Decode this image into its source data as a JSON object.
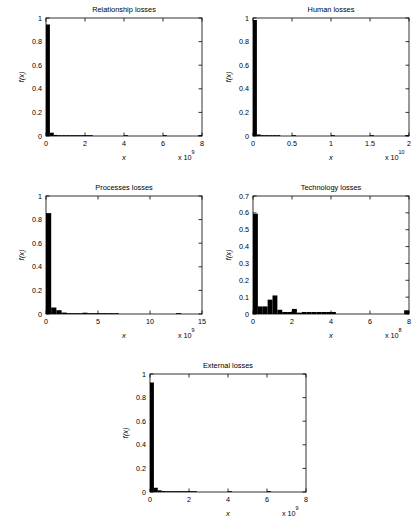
{
  "figure": {
    "name": "operational-risk-loss-severity-histograms",
    "panel_count": 5
  },
  "chart_data": [
    {
      "id": "relationship",
      "type": "bar",
      "title": "Relationship losses",
      "xlabel": "x",
      "ylabel": "f(x)",
      "x_exponent_prefix": "x 10",
      "x_exponent": "9",
      "xlim": [
        0,
        8
      ],
      "ylim": [
        0,
        1
      ],
      "xticks": [
        0,
        2,
        4,
        6,
        8
      ],
      "xticklabels": [
        "0",
        "2",
        "4",
        "6",
        "8"
      ],
      "yticks": [
        0,
        0.2,
        0.4,
        0.6,
        0.8,
        1
      ],
      "yticklabels": [
        "0",
        "0.2",
        "0.4",
        "0.6",
        "0.8",
        "1"
      ],
      "grid": false,
      "bin_width": 0.2,
      "bin_starts": [
        0,
        0.2,
        0.4,
        0.6,
        0.8,
        1.0,
        1.2,
        1.4,
        1.6,
        1.8,
        2.0,
        2.2,
        2.4,
        2.6,
        2.8,
        3.0,
        3.2,
        3.4,
        3.6,
        3.8,
        4.0,
        4.2,
        4.4,
        4.6,
        4.8,
        5.0,
        5.2,
        5.4,
        5.6,
        5.8,
        6.0,
        6.2,
        6.4,
        6.6,
        6.8,
        7.0,
        7.2,
        7.4,
        7.6,
        7.8
      ],
      "values": [
        0.945,
        0.028,
        0.009,
        0.005,
        0.004,
        0.002,
        0.002,
        0.001,
        0.001,
        0.001,
        0.002,
        0.001,
        0,
        0,
        0,
        0,
        0,
        0,
        0,
        0,
        0.001,
        0,
        0,
        0,
        0,
        0,
        0,
        0,
        0,
        0,
        0.001,
        0,
        0,
        0,
        0,
        0,
        0,
        0,
        0,
        0.001
      ]
    },
    {
      "id": "human",
      "type": "bar",
      "title": "Human losses",
      "xlabel": "x",
      "ylabel": "f(x)",
      "x_exponent_prefix": "x 10",
      "x_exponent": "10",
      "xlim": [
        0,
        2
      ],
      "ylim": [
        0,
        1
      ],
      "xticks": [
        0,
        0.5,
        1,
        1.5,
        2
      ],
      "xticklabels": [
        "0",
        "0.5",
        "1",
        "1.5",
        "2"
      ],
      "yticks": [
        0,
        0.2,
        0.4,
        0.6,
        0.8,
        1
      ],
      "yticklabels": [
        "0",
        "0.2",
        "0.4",
        "0.6",
        "0.8",
        "1"
      ],
      "grid": false,
      "bin_width": 0.05,
      "bin_starts": [
        0,
        0.05,
        0.1,
        0.15,
        0.2,
        0.25,
        0.3,
        0.35,
        0.4,
        0.45,
        0.5,
        0.55,
        0.6,
        0.65,
        0.7,
        0.75,
        0.8,
        0.85,
        0.9,
        0.95,
        1.0,
        1.05,
        1.1,
        1.15,
        1.2,
        1.25,
        1.3,
        1.35,
        1.4,
        1.45,
        1.5,
        1.55,
        1.6,
        1.65,
        1.7,
        1.75,
        1.8,
        1.85,
        1.9,
        1.95
      ],
      "values": [
        0.983,
        0.013,
        0.004,
        0.002,
        0.001,
        0.001,
        0.001,
        0,
        0,
        0,
        0.001,
        0,
        0,
        0,
        0,
        0,
        0,
        0,
        0,
        0,
        0.001,
        0,
        0,
        0,
        0,
        0,
        0,
        0,
        0,
        0,
        0.001,
        0,
        0,
        0,
        0,
        0,
        0,
        0,
        0,
        0.001
      ]
    },
    {
      "id": "processes",
      "type": "bar",
      "title": "Processes losses",
      "xlabel": "x",
      "ylabel": "f(x)",
      "x_exponent_prefix": "x 10",
      "x_exponent": "9",
      "xlim": [
        0,
        15
      ],
      "ylim": [
        0,
        1
      ],
      "xticks": [
        0,
        5,
        10,
        15
      ],
      "xticklabels": [
        "0",
        "5",
        "10",
        "15"
      ],
      "yticks": [
        0,
        0.2,
        0.4,
        0.6,
        0.8,
        1
      ],
      "yticklabels": [
        "0",
        "0.2",
        "0.4",
        "0.6",
        "0.8",
        "1"
      ],
      "grid": false,
      "bin_width": 0.5,
      "bin_starts": [
        0,
        0.5,
        1.0,
        1.5,
        2.0,
        2.5,
        3.0,
        3.5,
        4.0,
        4.5,
        5.0,
        5.5,
        6.0,
        6.5,
        7.0,
        7.5,
        8.0,
        8.5,
        9.0,
        9.5,
        10.0,
        10.5,
        11.0,
        11.5,
        12.0,
        12.5,
        13.0,
        13.5,
        14.0,
        14.5
      ],
      "values": [
        0.855,
        0.055,
        0.032,
        0.012,
        0.006,
        0.004,
        0.004,
        0.011,
        0.004,
        0.003,
        0.006,
        0.002,
        0.001,
        0.001,
        0,
        0,
        0,
        0,
        0,
        0,
        0,
        0,
        0,
        0,
        0,
        0.004,
        0,
        0,
        0,
        0
      ]
    },
    {
      "id": "technology",
      "type": "bar",
      "title": "Technology losses",
      "xlabel": "x",
      "ylabel": "f(x)",
      "x_exponent_prefix": "x 10",
      "x_exponent": "8",
      "xlim": [
        0,
        8
      ],
      "ylim": [
        0,
        0.7
      ],
      "xticks": [
        0,
        2,
        4,
        6,
        8
      ],
      "xticklabels": [
        "0",
        "2",
        "4",
        "6",
        "8"
      ],
      "yticks": [
        0,
        0.1,
        0.2,
        0.3,
        0.4,
        0.5,
        0.6,
        0.7
      ],
      "yticklabels": [
        "0",
        "0.1",
        "0.2",
        "0.3",
        "0.4",
        "0.5",
        "0.6",
        "0.7"
      ],
      "grid": false,
      "bin_width": 0.25,
      "bin_starts": [
        0,
        0.25,
        0.5,
        0.75,
        1.0,
        1.25,
        1.5,
        1.75,
        2.0,
        2.25,
        2.5,
        2.75,
        3.0,
        3.25,
        3.5,
        3.75,
        4.0,
        4.25,
        4.5,
        4.75,
        5.0,
        5.25,
        5.5,
        5.75,
        6.0,
        6.25,
        6.5,
        6.75,
        7.0,
        7.25,
        7.5,
        7.75
      ],
      "values": [
        0.595,
        0.045,
        0.045,
        0.085,
        0.11,
        0.025,
        0.012,
        0.012,
        0.03,
        0.008,
        0.012,
        0.012,
        0.012,
        0.012,
        0.012,
        0.012,
        0.012,
        0,
        0,
        0,
        0,
        0,
        0,
        0,
        0,
        0,
        0,
        0,
        0,
        0,
        0,
        0.022
      ]
    },
    {
      "id": "external",
      "type": "bar",
      "title": "External losses",
      "xlabel": "x",
      "ylabel": "f(x)",
      "x_exponent_prefix": "x 10",
      "x_exponent": "9",
      "xlim": [
        0,
        8
      ],
      "ylim": [
        0,
        1
      ],
      "xticks": [
        0,
        2,
        4,
        6,
        8
      ],
      "xticklabels": [
        "0",
        "2",
        "4",
        "6",
        "8"
      ],
      "yticks": [
        0,
        0.2,
        0.4,
        0.6,
        0.8,
        1
      ],
      "yticklabels": [
        "0",
        "0.2",
        "0.4",
        "0.6",
        "0.8",
        "1"
      ],
      "grid": false,
      "bin_width": 0.2,
      "bin_starts": [
        0,
        0.2,
        0.4,
        0.6,
        0.8,
        1.0,
        1.2,
        1.4,
        1.6,
        1.8,
        2.0,
        2.2,
        2.4,
        2.6,
        2.8,
        3.0,
        3.2,
        3.4,
        3.6,
        3.8,
        4.0,
        4.2,
        4.4,
        4.6,
        4.8,
        5.0,
        5.2,
        5.4,
        5.6,
        5.8,
        6.0,
        6.2,
        6.4,
        6.6,
        6.8,
        7.0,
        7.2,
        7.4,
        7.6,
        7.8
      ],
      "values": [
        0.928,
        0.036,
        0.014,
        0.008,
        0.004,
        0.002,
        0.001,
        0.001,
        0.001,
        0.001,
        0.004,
        0.001,
        0,
        0,
        0,
        0,
        0,
        0,
        0,
        0,
        0.001,
        0,
        0,
        0,
        0,
        0,
        0,
        0,
        0,
        0,
        0.003,
        0,
        0,
        0,
        0,
        0,
        0,
        0,
        0,
        0
      ]
    }
  ]
}
